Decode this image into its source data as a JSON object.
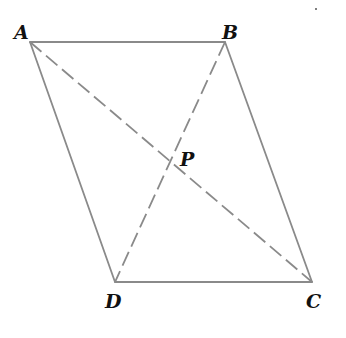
{
  "figure": {
    "type": "parallelogram-with-diagonals",
    "stroke_color": "#8a8a8a",
    "label_color": "#111111",
    "vertices": {
      "A": {
        "label": "A",
        "x": 30,
        "y": 42
      },
      "B": {
        "label": "B",
        "x": 225,
        "y": 42
      },
      "C": {
        "label": "C",
        "x": 312,
        "y": 282
      },
      "D": {
        "label": "D",
        "x": 115,
        "y": 282
      }
    },
    "intersection": {
      "label": "P",
      "x": 172,
      "y": 162
    },
    "sides": [
      "AB",
      "BC",
      "CD",
      "DA"
    ],
    "diagonals": [
      "AC",
      "BD"
    ],
    "diagonal_style": "dashed"
  }
}
